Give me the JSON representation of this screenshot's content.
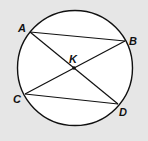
{
  "diagram": {
    "type": "circle-with-chords",
    "background": "#e6e6e6",
    "circle": {
      "cx": 75,
      "cy": 68,
      "r": 57.5,
      "fill": "#ffffff",
      "stroke": "#111111"
    },
    "points": {
      "A": {
        "label": "A",
        "x": 30,
        "y": 32,
        "label_x": 18,
        "label_y": 32
      },
      "B": {
        "label": "B",
        "x": 125,
        "y": 41,
        "label_x": 129,
        "label_y": 45
      },
      "C": {
        "label": "C",
        "x": 25,
        "y": 94,
        "label_x": 13,
        "label_y": 103
      },
      "D": {
        "label": "D",
        "x": 118,
        "y": 104,
        "label_x": 119,
        "label_y": 116
      },
      "K": {
        "label": "K",
        "x": 74,
        "y": 68,
        "label_x": 69,
        "label_y": 63
      }
    },
    "segments": [
      {
        "from": "A",
        "to": "B",
        "name": "AB"
      },
      {
        "from": "C",
        "to": "D",
        "name": "CD"
      },
      {
        "from": "A",
        "to": "D",
        "name": "AD"
      },
      {
        "from": "B",
        "to": "C",
        "name": "BC"
      }
    ],
    "intersection": {
      "label": "K",
      "of": [
        "AD",
        "BC"
      ]
    }
  }
}
